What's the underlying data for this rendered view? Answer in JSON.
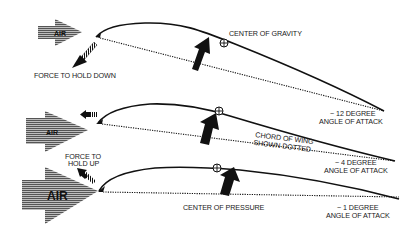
{
  "colors": {
    "ink": "#111111",
    "air_fill": "#6a6a6a",
    "background": "#ffffff"
  },
  "panels": [
    {
      "id": "high-aoa",
      "air_label": "AIR",
      "force_label": "FORCE TO HOLD DOWN",
      "aoa_line1": "~ 12 DEGREE",
      "aoa_line2": "ANGLE OF ATTACK",
      "cg_label": "CENTER OF GRAVITY"
    },
    {
      "id": "mid-aoa",
      "air_label": "AIR",
      "chord_line1": "CHORD OF WING",
      "chord_line2": "SHOWN DOTTED",
      "aoa_line1": "~ 4 DEGREE",
      "aoa_line2": "ANGLE OF ATTACK"
    },
    {
      "id": "low-aoa",
      "air_label": "AIR",
      "force_line1": "FORCE TO",
      "force_line2": "HOLD UP",
      "cp_label": "CENTER OF PRESSURE",
      "aoa_line1": "~ 1 DEGREE",
      "aoa_line2": "ANGLE OF ATTACK"
    }
  ],
  "icons": {
    "air_arrow": "striped-right-arrow",
    "lift_arrow": "thick-up-arrow",
    "force_arrow": "striped-arrow",
    "cg_symbol": "circle-plus"
  }
}
